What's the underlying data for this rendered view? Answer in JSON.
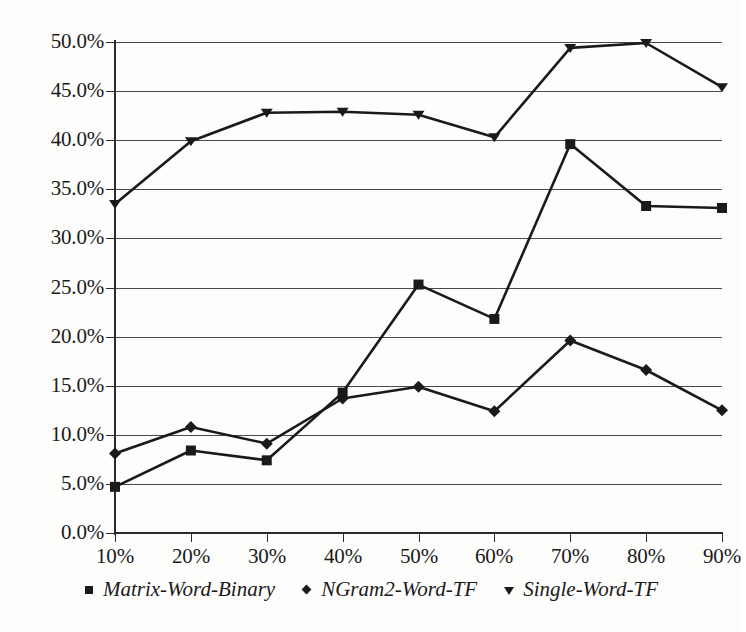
{
  "chart_data": {
    "type": "line",
    "title": "",
    "subtitle": "",
    "xlabel": "",
    "ylabel": "",
    "grid": true,
    "legend_position": "bottom",
    "x": [
      10,
      20,
      30,
      40,
      50,
      60,
      70,
      80,
      90
    ],
    "categories": [
      "10%",
      "20%",
      "30%",
      "40%",
      "50%",
      "60%",
      "70%",
      "80%",
      "90%"
    ],
    "xtick_labels": [
      "10%",
      "20%",
      "30%",
      "40%",
      "50%",
      "60%",
      "70%",
      "80%",
      "90%"
    ],
    "ytick_labels": [
      "0.0%",
      "5.0%",
      "10.0%",
      "15.0%",
      "20.0%",
      "25.0%",
      "30.0%",
      "35.0%",
      "40.0%",
      "45.0%",
      "50.0%"
    ],
    "ytick_values": [
      0,
      5,
      10,
      15,
      20,
      25,
      30,
      35,
      40,
      45,
      50
    ],
    "ylim": [
      0,
      50
    ],
    "xlim": [
      10,
      90
    ],
    "series": [
      {
        "name": "Matrix-Word-Binary",
        "marker": "square",
        "color": "#1a1a1a",
        "values": [
          4.7,
          8.4,
          7.4,
          14.3,
          25.3,
          21.8,
          39.6,
          33.3,
          33.1
        ]
      },
      {
        "name": "NGram2-Word-TF",
        "marker": "diamond",
        "color": "#1a1a1a",
        "values": [
          8.1,
          10.8,
          9.1,
          13.7,
          14.9,
          12.4,
          19.6,
          16.6,
          12.5
        ]
      },
      {
        "name": "Single-Word-TF",
        "marker": "triangle-down",
        "color": "#1a1a1a",
        "values": [
          33.5,
          39.9,
          42.8,
          42.9,
          42.6,
          40.3,
          49.4,
          49.9,
          45.4
        ]
      }
    ]
  },
  "legend": {
    "items": [
      {
        "label": "Matrix-Word-Binary",
        "marker": "square-marker"
      },
      {
        "label": "NGram2-Word-TF",
        "marker": "diamond-marker"
      },
      {
        "label": "Single-Word-TF",
        "marker": "triangle-down-marker"
      }
    ]
  },
  "colors": {
    "ink": "#1a1a1a",
    "gridline": "#4a4a4a",
    "axis": "#2b2b2b",
    "background": "#fdfdfc"
  }
}
